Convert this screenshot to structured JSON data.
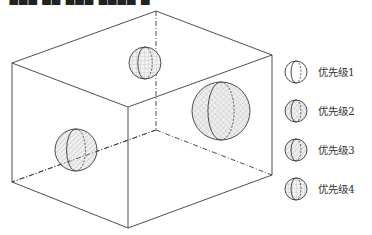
{
  "caption": {
    "text": "▀▆▇▅ ▆▇ ▅▆▇ ▇▆▅▇  ▄",
    "note": "cropped line of text at top edge, illegible"
  },
  "colors": {
    "line": "#3a3a3a",
    "sphere_fill": "#ececec",
    "hatch": "#9a9a9a",
    "background": "#ffffff"
  },
  "box": {
    "vertices": {
      "top_back": [
        156,
        11
      ],
      "top_left": [
        12,
        63
      ],
      "top_right": [
        272,
        55
      ],
      "top_front": [
        128,
        107
      ],
      "bottom_left": [
        12,
        182
      ],
      "bottom_front": [
        128,
        228
      ],
      "bottom_right": [
        272,
        175
      ],
      "bottom_back_hidden": [
        156,
        130
      ]
    }
  },
  "spheres": [
    {
      "id": "top-sphere",
      "cx": 145,
      "cy": 63,
      "r": 16,
      "priority": 4
    },
    {
      "id": "right-sphere",
      "cx": 221,
      "cy": 111,
      "r": 29,
      "priority": 2
    },
    {
      "id": "left-sphere",
      "cx": 76,
      "cy": 150,
      "r": 21,
      "priority": 3
    }
  ],
  "legend": {
    "items": [
      {
        "label": "优先级1",
        "pattern": "none",
        "cy": 72
      },
      {
        "label": "优先级2",
        "pattern": "crosshatch",
        "cy": 111
      },
      {
        "label": "优先级3",
        "pattern": "diagonal",
        "cy": 150
      },
      {
        "label": "优先级4",
        "pattern": "grid",
        "cy": 189
      }
    ]
  }
}
